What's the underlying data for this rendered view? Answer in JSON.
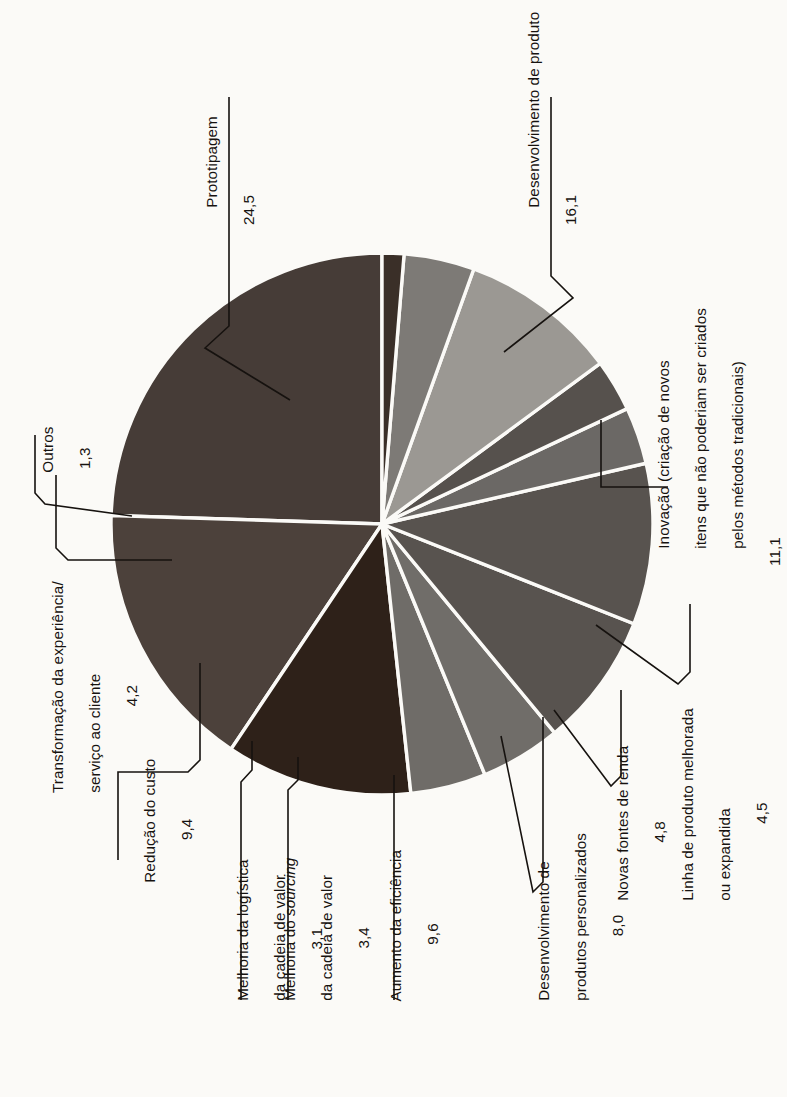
{
  "chart_data": {
    "type": "pie",
    "title": "",
    "subtitle": "",
    "xlabel": "",
    "ylabel": "",
    "legend_position": "callout-labels",
    "grid": false,
    "value_total": 100.0,
    "value_format": "comma-decimal",
    "rotation_deg": -90,
    "categories": [
      "Prototipagem",
      "Desenvolvimento de produto",
      "Inovação (criação de novos itens que não poderiam ser criados pelos métodos tradicionais)",
      "Linha de produto melhorada ou expandida",
      "Novas fontes de renda",
      "Desenvolvimento de produtos personalizados",
      "Aumento da eficiência",
      "Melhoria do sourcing da cadeia de valor",
      "Melhoria da logística da cadeia de valor",
      "Redução do custo",
      "Transformação da experiência/ serviço ao cliente",
      "Outros"
    ],
    "values": [
      24.5,
      16.1,
      11.1,
      4.5,
      4.8,
      8.0,
      9.6,
      3.4,
      3.1,
      9.4,
      4.2,
      1.3
    ],
    "colors": [
      "#463c37",
      "#4c413b",
      "#2e2119",
      "#6f6c68",
      "#706d69",
      "#58534f",
      "#58534f",
      "#6b6865",
      "#56514d",
      "#9b9893",
      "#7d7a76",
      "#3a2f28"
    ]
  },
  "slices": [
    {
      "id": "prototipagem",
      "label_line1": "Prototipagem",
      "value": "24,5"
    },
    {
      "id": "desenvolvimento-de-produto",
      "label_line1": "Desenvolvimento de produto",
      "value": "16,1"
    },
    {
      "id": "inovacao",
      "label_line1": "Inovação (criação de novos",
      "label_line2": "itens que não poderiam ser criados",
      "label_line3": "pelos métodos tradicionais)",
      "value": "11,1"
    },
    {
      "id": "linha-de-produto",
      "label_line1": "Linha de produto melhorada",
      "label_line2": "ou expandida",
      "value": "4,5"
    },
    {
      "id": "novas-fontes-de-renda",
      "label_line1": "Novas fontes de renda",
      "value": "4,8"
    },
    {
      "id": "produtos-personalizados",
      "label_line1": "Desenvolvimento de",
      "label_line2": "produtos personalizados",
      "value": "8,0"
    },
    {
      "id": "aumento-da-eficiencia",
      "label_line1": "Aumento da eficiência",
      "value": "9,6"
    },
    {
      "id": "melhoria-sourcing",
      "label_pre": "Melhoria do ",
      "label_em": "sourcing",
      "label_line2": "da cadeia de valor",
      "value": "3,4"
    },
    {
      "id": "melhoria-logistica",
      "label_line1": "Melhoria da logística",
      "label_line2": "da cadeia de valor",
      "value": "3,1"
    },
    {
      "id": "reducao-do-custo",
      "label_line1": "Redução do custo",
      "value": "9,4"
    },
    {
      "id": "transformacao-experiencia",
      "label_line1": "Transformação da experiência/",
      "label_line2": "serviço ao cliente",
      "value": "4,2"
    },
    {
      "id": "outros",
      "label_line1": "Outros",
      "value": "1,3"
    }
  ]
}
